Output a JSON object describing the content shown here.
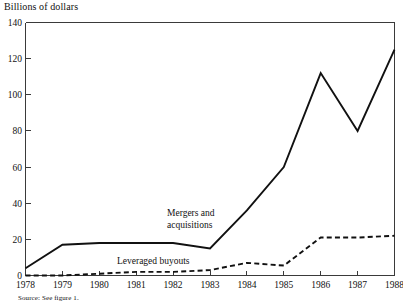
{
  "chart_data": {
    "type": "line",
    "title": "Billions of dollars",
    "xlabel": "",
    "ylabel": "Billions of dollars",
    "grid": false,
    "legend_position": "inline-annotations",
    "x": [
      1978,
      1979,
      1980,
      1981,
      1982,
      1983,
      1984,
      1985,
      1986,
      1987,
      1988
    ],
    "categories": [
      "1978",
      "1979",
      "1980",
      "1981",
      "1982",
      "1983",
      "1984",
      "1985",
      "1986",
      "1987",
      "1988"
    ],
    "xlim": [
      1978,
      1988
    ],
    "ylim": [
      0,
      140
    ],
    "yticks": [
      0,
      20,
      40,
      60,
      80,
      100,
      120,
      140
    ],
    "ytick_labels": [
      "0",
      "20",
      "40",
      "60",
      "80",
      "100",
      "120",
      "140"
    ],
    "series": [
      {
        "name": "Mergers and acquisitions",
        "style": "solid",
        "values": [
          4,
          17,
          18,
          18,
          18,
          15,
          36,
          60,
          112,
          80,
          125
        ]
      },
      {
        "name": "Leveraged buyouts",
        "style": "dashed",
        "values": [
          0,
          0,
          1,
          2,
          2,
          3,
          7,
          5.5,
          21,
          21,
          22
        ]
      }
    ],
    "annotations": [
      {
        "text_line1": "Mergers and",
        "text_line2": "acquisitions"
      },
      {
        "text": "Leveraged buyouts"
      }
    ]
  },
  "labels": {
    "axis_title": "Billions of dollars",
    "source_note": "Source: See figure 1.",
    "series_mna_line1": "Mergers and",
    "series_mna_line2": "acquisitions",
    "series_lbo": "Leveraged buyouts"
  },
  "ytick_labels": [
    "140",
    "120",
    "100",
    "80",
    "60",
    "40",
    "20",
    "0"
  ],
  "xtick_labels": [
    "1978",
    "1979",
    "1980",
    "1981",
    "1982",
    "1983",
    "1984",
    "1985",
    "1986",
    "1987",
    "1988"
  ],
  "colors": {
    "line": "#111111",
    "axis": "#3a3a3a",
    "background": "#ffffff"
  }
}
